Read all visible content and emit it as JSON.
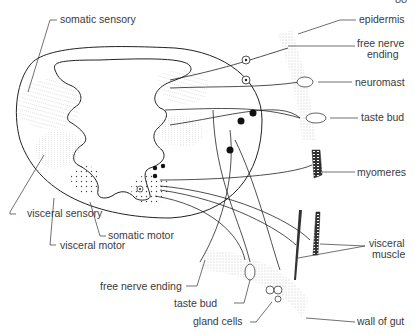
{
  "figure": {
    "page_number_fragment": "88",
    "labels": {
      "somatic_sensory": "somatic sensory",
      "visceral_sensory": "visceral sensory",
      "visceral_motor": "visceral motor",
      "somatic_motor": "somatic motor",
      "epidermis": "epidermis",
      "free_nerve_ending_skin_line1": "free nerve",
      "free_nerve_ending_skin_line2": "ending",
      "neuromast": "neuromast",
      "taste_bud_skin": "taste bud",
      "myomeres": "myomeres",
      "visceral_muscle_line1": "visceral",
      "visceral_muscle_line2": "muscle",
      "free_nerve_ending_gut": "free nerve ending",
      "taste_bud_gut": "taste bud",
      "gland_cells": "gland cells",
      "wall_of_gut": "wall of gut"
    }
  }
}
